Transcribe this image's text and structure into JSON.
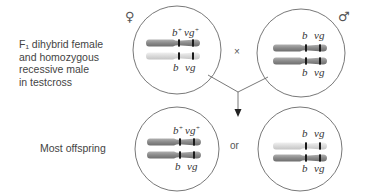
{
  "diagram": {
    "cross_label": "F₁ dihybrid female\nand homozygous\nrecessive male\nin testcross",
    "offspring_label": "Most offspring",
    "female_symbol": "♀",
    "male_symbol": "♂",
    "cross_symbol": "×",
    "or_label": "or",
    "colors": {
      "dark_chromosome": "#8c8c8c",
      "light_chromosome": "#d9d9d9",
      "band": "#1a1a1a",
      "circle_stroke": "#555555",
      "line": "#555555"
    },
    "cells": [
      {
        "id": "female-parent",
        "top_labels": [
          "b+",
          "vg+"
        ],
        "bottom_labels": [
          "b",
          "vg"
        ],
        "chromosomes": [
          "dark",
          "light"
        ]
      },
      {
        "id": "male-parent",
        "top_labels": [
          "b",
          "vg"
        ],
        "bottom_labels": [
          "b",
          "vg"
        ],
        "chromosomes": [
          "dark",
          "dark"
        ]
      },
      {
        "id": "offspring-1",
        "top_labels": [
          "b+",
          "vg+"
        ],
        "bottom_labels": [
          "b",
          "vg"
        ],
        "chromosomes": [
          "dark",
          "dark"
        ]
      },
      {
        "id": "offspring-2",
        "top_labels": [
          "b",
          "vg"
        ],
        "bottom_labels": [
          "b",
          "vg"
        ],
        "chromosomes": [
          "light",
          "dark"
        ]
      }
    ]
  }
}
